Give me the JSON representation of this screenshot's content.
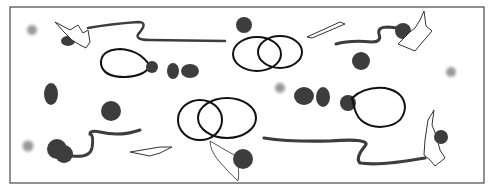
{
  "figure": {
    "colors": {
      "background": "#ffffff",
      "frame": "#555555",
      "fill_dark": "#3d3d3d",
      "outline": "#111111",
      "spot": "#999999"
    }
  }
}
